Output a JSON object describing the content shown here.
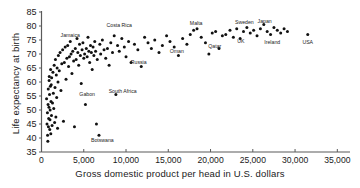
{
  "chart_data": {
    "type": "scatter",
    "title": "",
    "xlabel": "Gross domestic product per head in U.S. dollars",
    "ylabel": "Life expectancy at birth",
    "xlim": [
      0,
      36500
    ],
    "ylim": [
      35,
      85
    ],
    "xticks": [
      0,
      5000,
      10000,
      15000,
      20000,
      25000,
      30000,
      35000
    ],
    "xticklabels": [
      "0",
      "5,000",
      "10,000",
      "15,000",
      "20,000",
      "25,000",
      "30,000",
      "35,000"
    ],
    "yticks": [
      35,
      40,
      45,
      50,
      55,
      60,
      65,
      70,
      75,
      80,
      85
    ],
    "yticklabels": [
      "35",
      "40",
      "45",
      "50",
      "55",
      "60",
      "65",
      "70",
      "75",
      "80",
      "85"
    ],
    "grid": false,
    "legend": null,
    "marker": "filled-circle",
    "marker_color": "#111111",
    "annotations": [
      {
        "text": "Jamaica",
        "x": 3400,
        "y": 76.0
      },
      {
        "text": "Costa Rica",
        "x": 9200,
        "y": 79.5
      },
      {
        "text": "Russia",
        "x": 11500,
        "y": 66.5
      },
      {
        "text": "Gabon",
        "x": 5400,
        "y": 55.0
      },
      {
        "text": "South Africa",
        "x": 9600,
        "y": 56.2
      },
      {
        "text": "Botswana",
        "x": 7200,
        "y": 38.6
      },
      {
        "text": "Malta",
        "x": 18300,
        "y": 80.5
      },
      {
        "text": "Oman",
        "x": 16000,
        "y": 70.2
      },
      {
        "text": "Qatar",
        "x": 20500,
        "y": 72.0
      },
      {
        "text": "Sweden",
        "x": 24000,
        "y": 80.8
      },
      {
        "text": "UK",
        "x": 23600,
        "y": 73.9
      },
      {
        "text": "Japan",
        "x": 26400,
        "y": 81.0
      },
      {
        "text": "Ireland",
        "x": 27300,
        "y": 73.4
      },
      {
        "text": "USA",
        "x": 31500,
        "y": 73.6
      }
    ],
    "points": [
      [
        600,
        54.0
      ],
      [
        650,
        45.0
      ],
      [
        700,
        49.0
      ],
      [
        720,
        41.0
      ],
      [
        750,
        38.8
      ],
      [
        780,
        52.0
      ],
      [
        800,
        57.5
      ],
      [
        820,
        44.0
      ],
      [
        850,
        47.0
      ],
      [
        880,
        51.0
      ],
      [
        900,
        60.5
      ],
      [
        920,
        62.0
      ],
      [
        950,
        55.5
      ],
      [
        980,
        43.0
      ],
      [
        1000,
        46.5
      ],
      [
        1020,
        50.0
      ],
      [
        1050,
        58.5
      ],
      [
        1080,
        64.5
      ],
      [
        1100,
        41.5
      ],
      [
        1120,
        53.0
      ],
      [
        1150,
        59.0
      ],
      [
        1180,
        48.0
      ],
      [
        1200,
        61.5
      ],
      [
        1250,
        44.5
      ],
      [
        1300,
        52.5
      ],
      [
        1350,
        63.5
      ],
      [
        1400,
        56.0
      ],
      [
        1450,
        50.5
      ],
      [
        1500,
        66.0
      ],
      [
        1550,
        45.5
      ],
      [
        1600,
        58.0
      ],
      [
        1650,
        68.0
      ],
      [
        1700,
        47.5
      ],
      [
        1750,
        62.5
      ],
      [
        1800,
        54.5
      ],
      [
        1850,
        65.0
      ],
      [
        1900,
        43.5
      ],
      [
        1950,
        60.0
      ],
      [
        2000,
        69.5
      ],
      [
        2100,
        64.0
      ],
      [
        2200,
        70.5
      ],
      [
        2300,
        57.0
      ],
      [
        2400,
        66.5
      ],
      [
        2500,
        71.5
      ],
      [
        2600,
        46.0
      ],
      [
        2700,
        67.0
      ],
      [
        2800,
        72.5
      ],
      [
        2900,
        61.0
      ],
      [
        3000,
        68.5
      ],
      [
        3100,
        73.0
      ],
      [
        3200,
        65.5
      ],
      [
        3300,
        69.0
      ],
      [
        3400,
        74.5
      ],
      [
        3500,
        70.0
      ],
      [
        3600,
        63.0
      ],
      [
        3700,
        71.0
      ],
      [
        3800,
        67.5
      ],
      [
        3900,
        44.0
      ],
      [
        4000,
        72.0
      ],
      [
        4100,
        68.0
      ],
      [
        4200,
        75.5
      ],
      [
        4300,
        70.5
      ],
      [
        4400,
        66.0
      ],
      [
        4500,
        73.5
      ],
      [
        4600,
        69.5
      ],
      [
        4700,
        59.5
      ],
      [
        4800,
        71.5
      ],
      [
        4900,
        74.0
      ],
      [
        5000,
        68.5
      ],
      [
        5100,
        70.0
      ],
      [
        5200,
        52.0
      ],
      [
        5300,
        72.0
      ],
      [
        5400,
        69.0
      ],
      [
        5500,
        76.0
      ],
      [
        5600,
        71.0
      ],
      [
        5700,
        67.0
      ],
      [
        5800,
        73.0
      ],
      [
        5900,
        70.5
      ],
      [
        6000,
        64.5
      ],
      [
        6100,
        72.5
      ],
      [
        6200,
        69.5
      ],
      [
        6300,
        74.5
      ],
      [
        6400,
        71.0
      ],
      [
        6500,
        45.0
      ],
      [
        6600,
        68.0
      ],
      [
        6800,
        41.0
      ],
      [
        6900,
        73.5
      ],
      [
        7000,
        70.0
      ],
      [
        7200,
        75.0
      ],
      [
        7400,
        71.5
      ],
      [
        7600,
        68.5
      ],
      [
        7800,
        72.0
      ],
      [
        8000,
        66.0
      ],
      [
        8200,
        74.0
      ],
      [
        8400,
        70.5
      ],
      [
        8600,
        76.5
      ],
      [
        8800,
        55.5
      ],
      [
        9000,
        73.0
      ],
      [
        9200,
        71.0
      ],
      [
        9500,
        75.5
      ],
      [
        9800,
        72.5
      ],
      [
        10000,
        69.0
      ],
      [
        10300,
        74.5
      ],
      [
        10600,
        67.0
      ],
      [
        11000,
        73.5
      ],
      [
        11400,
        71.5
      ],
      [
        11800,
        65.5
      ],
      [
        12200,
        76.0
      ],
      [
        12600,
        74.0
      ],
      [
        13000,
        72.0
      ],
      [
        13400,
        75.0
      ],
      [
        13900,
        70.5
      ],
      [
        14300,
        73.0
      ],
      [
        14800,
        76.5
      ],
      [
        15200,
        74.5
      ],
      [
        15700,
        72.5
      ],
      [
        16200,
        69.5
      ],
      [
        16700,
        75.5
      ],
      [
        17200,
        73.5
      ],
      [
        17600,
        77.0
      ],
      [
        18000,
        78.5
      ],
      [
        18400,
        79.0
      ],
      [
        18900,
        76.0
      ],
      [
        19400,
        74.0
      ],
      [
        19800,
        70.0
      ],
      [
        20200,
        77.5
      ],
      [
        20600,
        78.0
      ],
      [
        21000,
        72.0
      ],
      [
        21400,
        76.5
      ],
      [
        21800,
        77.0
      ],
      [
        22300,
        78.5
      ],
      [
        22700,
        76.0
      ],
      [
        23100,
        79.0
      ],
      [
        23500,
        75.5
      ],
      [
        23900,
        78.0
      ],
      [
        24300,
        79.5
      ],
      [
        24700,
        77.5
      ],
      [
        25100,
        78.5
      ],
      [
        25500,
        76.5
      ],
      [
        25900,
        79.0
      ],
      [
        26300,
        80.5
      ],
      [
        26700,
        78.0
      ],
      [
        27100,
        77.0
      ],
      [
        27500,
        79.5
      ],
      [
        27900,
        78.5
      ],
      [
        28300,
        77.5
      ],
      [
        28700,
        79.0
      ],
      [
        29100,
        78.0
      ],
      [
        31500,
        77.0
      ]
    ]
  }
}
